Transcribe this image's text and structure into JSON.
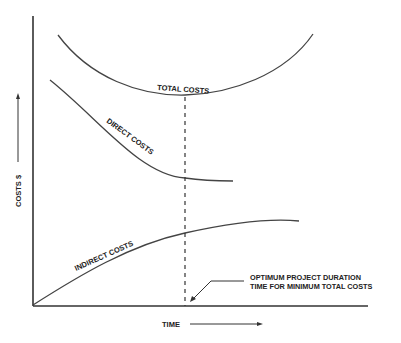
{
  "diagram": {
    "type": "cost-time tradeoff",
    "y_axis_label": "COSTS $",
    "x_axis_label": "TIME",
    "curves": [
      {
        "name": "TOTAL COSTS",
        "shape": "U-shaped, minimum at optimum duration"
      },
      {
        "name": "DIRECT COSTS",
        "shape": "decreasing with time"
      },
      {
        "name": "INDIRECT COSTS",
        "shape": "increasing with time"
      }
    ],
    "annotation_line1": "OPTIMUM PROJECT DURATION",
    "annotation_line2": "TIME FOR MINIMUM TOTAL COSTS",
    "color": "#333333"
  }
}
